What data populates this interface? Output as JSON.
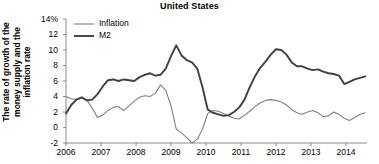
{
  "chart_data": {
    "type": "line",
    "title": "United States",
    "xlabel": "",
    "ylabel": "The rate of growth of the money supply and the inflation rate",
    "ylabel_lines": [
      "The rate of growth of the",
      "money supply and the",
      "inflation rate"
    ],
    "ylim": [
      -2,
      14
    ],
    "xlim": [
      2006,
      2014.6
    ],
    "grid": false,
    "legend_position": "top-left",
    "ytick_labels": [
      "14%",
      "12",
      "10",
      "8",
      "6",
      "4",
      "2",
      "0",
      "-2"
    ],
    "ytick_values": [
      14,
      12,
      10,
      8,
      6,
      4,
      2,
      0,
      -2
    ],
    "xtick_labels": [
      "2006",
      "2007",
      "2008",
      "2009",
      "2010",
      "2011",
      "2012",
      "2013",
      "2014"
    ],
    "xtick_values": [
      2006,
      2007,
      2008,
      2009,
      2010,
      2011,
      2012,
      2013,
      2014
    ],
    "colors": {
      "inflation": "#808080",
      "m2": "#404040",
      "axis": "#808080",
      "text": "#000000"
    },
    "series": [
      {
        "name": "Inflation",
        "color": "#808080",
        "linewidth": 1.1,
        "x": [
          2006.0,
          2006.15,
          2006.3,
          2006.45,
          2006.6,
          2006.75,
          2006.9,
          2007.05,
          2007.2,
          2007.35,
          2007.5,
          2007.65,
          2007.8,
          2007.95,
          2008.1,
          2008.25,
          2008.4,
          2008.55,
          2008.7,
          2008.85,
          2009.0,
          2009.15,
          2009.3,
          2009.45,
          2009.6,
          2009.75,
          2009.9,
          2010.05,
          2010.2,
          2010.35,
          2010.5,
          2010.65,
          2010.8,
          2010.95,
          2011.1,
          2011.25,
          2011.4,
          2011.55,
          2011.7,
          2011.85,
          2012.0,
          2012.15,
          2012.3,
          2012.45,
          2012.6,
          2012.75,
          2012.9,
          2013.05,
          2013.2,
          2013.35,
          2013.5,
          2013.65,
          2013.8,
          2013.95,
          2014.1,
          2014.25,
          2014.4,
          2014.55
        ],
        "y": [
          4.0,
          3.7,
          3.6,
          3.8,
          3.5,
          2.5,
          1.3,
          1.6,
          2.2,
          2.6,
          2.7,
          2.2,
          2.8,
          3.4,
          3.9,
          4.1,
          4.0,
          4.4,
          5.5,
          4.8,
          2.8,
          -0.2,
          -0.7,
          -1.3,
          -2.0,
          -1.5,
          -0.2,
          1.8,
          2.2,
          2.1,
          1.8,
          1.5,
          1.2,
          1.1,
          1.6,
          2.1,
          2.7,
          3.2,
          3.5,
          3.6,
          3.5,
          3.3,
          2.9,
          2.3,
          1.9,
          1.7,
          2.0,
          2.2,
          1.9,
          1.4,
          1.5,
          2.0,
          1.7,
          1.2,
          0.9,
          1.3,
          1.7,
          1.9
        ]
      },
      {
        "name": "M2",
        "color": "#404040",
        "linewidth": 1.9,
        "x": [
          2006.0,
          2006.15,
          2006.3,
          2006.45,
          2006.6,
          2006.75,
          2006.9,
          2007.05,
          2007.2,
          2007.35,
          2007.5,
          2007.65,
          2007.8,
          2007.95,
          2008.1,
          2008.25,
          2008.4,
          2008.55,
          2008.7,
          2008.85,
          2009.0,
          2009.15,
          2009.3,
          2009.45,
          2009.6,
          2009.75,
          2009.9,
          2010.05,
          2010.2,
          2010.35,
          2010.5,
          2010.65,
          2010.8,
          2010.95,
          2011.1,
          2011.25,
          2011.4,
          2011.55,
          2011.7,
          2011.85,
          2012.0,
          2012.15,
          2012.3,
          2012.45,
          2012.6,
          2012.75,
          2012.9,
          2013.05,
          2013.2,
          2013.35,
          2013.5,
          2013.65,
          2013.8,
          2013.95,
          2014.1,
          2014.25,
          2014.4,
          2014.55
        ],
        "y": [
          1.8,
          2.9,
          3.6,
          3.9,
          3.5,
          3.6,
          4.3,
          5.3,
          6.1,
          6.2,
          6.0,
          6.2,
          6.1,
          6.0,
          6.5,
          6.8,
          7.0,
          6.7,
          6.8,
          7.6,
          9.2,
          10.6,
          9.3,
          8.7,
          8.4,
          7.6,
          5.2,
          2.3,
          1.9,
          1.7,
          1.5,
          1.6,
          2.0,
          2.6,
          3.6,
          5.2,
          6.6,
          7.7,
          8.5,
          9.4,
          10.1,
          10.0,
          9.4,
          8.4,
          7.9,
          7.9,
          7.6,
          7.4,
          7.5,
          7.2,
          7.0,
          6.9,
          6.7,
          5.6,
          5.9,
          6.2,
          6.4,
          6.6
        ]
      }
    ],
    "legend": [
      {
        "label": "Inflation",
        "color": "#808080",
        "linewidth": 1.1
      },
      {
        "label": "M2",
        "color": "#404040",
        "linewidth": 1.9
      }
    ]
  }
}
